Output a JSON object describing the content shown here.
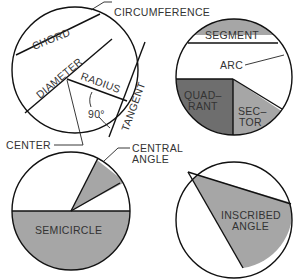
{
  "colors": {
    "light_fill": "#a6a6a6",
    "dark_fill": "#6e6e6e",
    "line": "#111111",
    "background": "#ffffff"
  },
  "diagram1": {
    "labels": {
      "circumference": "CIRCUMFERENCE",
      "chord": "CHORD",
      "diameter": "DIAMETER",
      "radius": "RADIUS",
      "angle": "90°",
      "tangent": "TANGENT",
      "center": "CENTER"
    }
  },
  "diagram2": {
    "labels": {
      "segment": "SEGMENT",
      "arc": "ARC",
      "quadrant_1": "QUAD–",
      "quadrant_2": "RANT",
      "sector_1": "SEC–",
      "sector_2": "TOR"
    }
  },
  "diagram3": {
    "labels": {
      "central_angle_1": "CENTRAL",
      "central_angle_2": "ANGLE",
      "semicircle": "SEMICIRCLE"
    }
  },
  "diagram4": {
    "labels": {
      "inscribed_1": "INSCRIBED",
      "inscribed_2": "ANGLE"
    }
  }
}
